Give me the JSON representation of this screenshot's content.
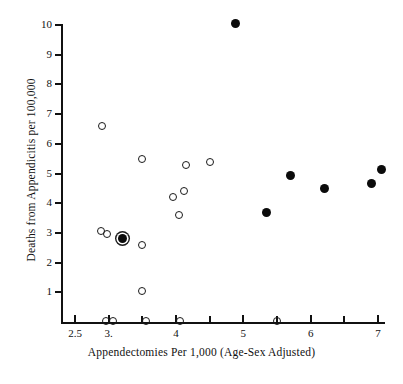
{
  "figure": {
    "width": 403,
    "height": 384,
    "background": "#ffffff",
    "ink_color": "#111111"
  },
  "chart_data": {
    "type": "scatter",
    "title": "",
    "xlabel": "Appendectomies Per 1,000 (Age-Sex Adjusted)",
    "ylabel": "Deaths from Appendicitis per 100,000",
    "xlim": [
      2.25,
      7.35
    ],
    "ylim": [
      0,
      10.4
    ],
    "grid": false,
    "legend": "none",
    "xticks": [
      2.5,
      3.0,
      3.5,
      4.0,
      4.5,
      5.0,
      5.5,
      6.0,
      6.5,
      7.0
    ],
    "xtick_labels": [
      "2.5",
      "3.",
      "",
      "4",
      "",
      "5",
      "",
      "6",
      "",
      "7"
    ],
    "yticks": [
      1,
      2,
      3,
      4,
      5,
      6,
      7,
      8,
      9,
      10
    ],
    "ytick_labels": [
      "1",
      "2",
      "3",
      "4",
      "5",
      "6",
      "7",
      "8",
      "9",
      "10"
    ],
    "series": [
      {
        "name": "open-marker-points",
        "marker": "open-circle",
        "color": "#1a1a1a",
        "points": [
          {
            "x": 2.9,
            "y": 6.6
          },
          {
            "x": 3.5,
            "y": 5.5
          },
          {
            "x": 4.15,
            "y": 5.3
          },
          {
            "x": 4.5,
            "y": 5.38
          },
          {
            "x": 3.95,
            "y": 4.2
          },
          {
            "x": 4.12,
            "y": 4.4
          },
          {
            "x": 4.05,
            "y": 3.6
          },
          {
            "x": 2.88,
            "y": 3.05
          },
          {
            "x": 2.98,
            "y": 2.95
          },
          {
            "x": 3.5,
            "y": 2.6
          },
          {
            "x": 3.5,
            "y": 1.05
          },
          {
            "x": 2.96,
            "y": 0.05
          },
          {
            "x": 3.06,
            "y": 0.05
          },
          {
            "x": 3.56,
            "y": 0.05
          },
          {
            "x": 4.06,
            "y": 0.05
          },
          {
            "x": 5.5,
            "y": 0.05
          }
        ]
      },
      {
        "name": "filled-marker-points",
        "marker": "filled-circle",
        "color": "#0b0b0b",
        "points": [
          {
            "x": 4.88,
            "y": 10.05
          },
          {
            "x": 5.7,
            "y": 4.92
          },
          {
            "x": 7.05,
            "y": 5.15
          },
          {
            "x": 6.9,
            "y": 4.65
          },
          {
            "x": 6.2,
            "y": 4.5
          },
          {
            "x": 5.35,
            "y": 3.68
          }
        ]
      },
      {
        "name": "filled-with-open-ring-points",
        "marker": "filled-circle-with-open-ring",
        "color": "#0b0b0b",
        "points": [
          {
            "x": 3.2,
            "y": 2.8
          }
        ]
      }
    ]
  }
}
